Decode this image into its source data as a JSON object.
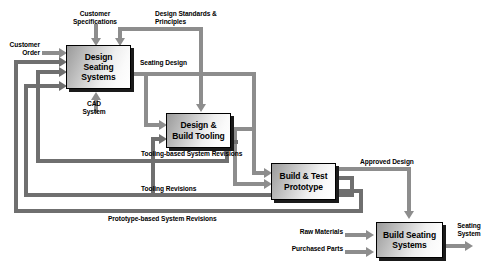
{
  "diagram": {
    "type": "process-flow-diagram",
    "line_color": "#8d8d8d",
    "line_color_dark": "#6f6f6f",
    "box_border_color": "#000000",
    "background": "#ffffff"
  },
  "boxes": [
    {
      "id": "design-seating-systems",
      "label": "Design\nSeating Systems"
    },
    {
      "id": "design-build-tooling",
      "label": "Design &\nBuild Tooling"
    },
    {
      "id": "build-test-prototype",
      "label": "Build & Test\nPrototype"
    },
    {
      "id": "build-seating-systems",
      "label": "Build Seating\nSystems"
    }
  ],
  "labels": {
    "customer_specifications": "Customer\nSpecifications",
    "customer_order": "Customer\nOrder",
    "design_standards": "Design Standards &\nPrinciples",
    "cad_system": "CAD\nSystem",
    "seating_design": "Seating Design",
    "tooling_based_system_revisions": "Tooling-based System Revisions",
    "tooling_revisions": "Tooling Revisions",
    "prototype_based_system_revisions": "Prototype-based System Revisions",
    "approved_design": "Approved Design",
    "raw_materials": "Raw Materials",
    "purchased_parts": "Purchased Parts",
    "seating_system": "Seating\nSystem"
  }
}
